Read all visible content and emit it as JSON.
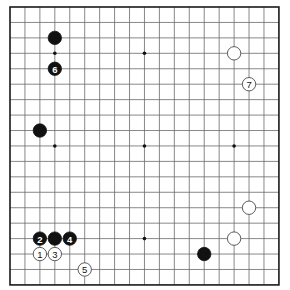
{
  "board": {
    "size": 19,
    "origin_x": 10,
    "origin_y": 7,
    "spacing_x": 14.94,
    "spacing_y": 15.44,
    "stone_radius": 6.7,
    "colors": {
      "black": "#111111",
      "white": "#ffffff",
      "line": "#6a6a6a",
      "border": "#1a1a1a"
    },
    "star_points": [
      [
        3,
        3
      ],
      [
        9,
        3
      ],
      [
        15,
        3
      ],
      [
        3,
        9
      ],
      [
        9,
        9
      ],
      [
        15,
        9
      ],
      [
        3,
        15
      ],
      [
        9,
        15
      ],
      [
        15,
        15
      ]
    ]
  },
  "stones": [
    {
      "color": "black",
      "col": 3,
      "row": 2,
      "label": ""
    },
    {
      "color": "black",
      "col": 3,
      "row": 4,
      "label": "6"
    },
    {
      "color": "black",
      "col": 2,
      "row": 8,
      "label": ""
    },
    {
      "color": "white",
      "col": 15,
      "row": 3,
      "label": ""
    },
    {
      "color": "white",
      "col": 16,
      "row": 5,
      "label": "7"
    },
    {
      "color": "white",
      "col": 16,
      "row": 13,
      "label": ""
    },
    {
      "color": "white",
      "col": 15,
      "row": 15,
      "label": ""
    },
    {
      "color": "black",
      "col": 13,
      "row": 16,
      "label": ""
    },
    {
      "color": "black",
      "col": 2,
      "row": 15,
      "label": "2"
    },
    {
      "color": "black",
      "col": 3,
      "row": 15,
      "label": ""
    },
    {
      "color": "black",
      "col": 4,
      "row": 15,
      "label": "4"
    },
    {
      "color": "white",
      "col": 2,
      "row": 16,
      "label": "1"
    },
    {
      "color": "white",
      "col": 3,
      "row": 16,
      "label": "3"
    },
    {
      "color": "white",
      "col": 5,
      "row": 17,
      "label": "5"
    }
  ]
}
